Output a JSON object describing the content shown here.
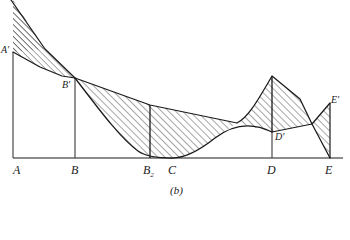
{
  "figure": {
    "caption": "(b)",
    "axis_labels": [
      {
        "id": "A",
        "text": "A",
        "x": 13,
        "y": 171
      },
      {
        "id": "B",
        "text": "B",
        "x": 71,
        "y": 171
      },
      {
        "id": "B2",
        "text": "B",
        "sub": "2",
        "x": 144,
        "y": 171
      },
      {
        "id": "C",
        "text": "C",
        "x": 170,
        "y": 171
      },
      {
        "id": "D",
        "text": "D",
        "x": 267,
        "y": 171
      },
      {
        "id": "E",
        "text": "E",
        "x": 325,
        "y": 171
      }
    ],
    "point_labels": [
      {
        "id": "Aprime",
        "text": "A′",
        "x": 2,
        "y": 46
      },
      {
        "id": "Bprime",
        "text": "B′",
        "x": 62,
        "y": 80
      },
      {
        "id": "Dprime",
        "text": "D′",
        "x": 274,
        "y": 131
      },
      {
        "id": "Eprime",
        "text": "E′",
        "x": 330,
        "y": 97
      }
    ],
    "colors": {
      "stroke": "#1a1a1a",
      "hatch": "#2b2b2b",
      "background": "#ffffff",
      "ordinate": "#3a3a3a"
    },
    "geometry": {
      "baseline_y": 158,
      "x_A": 13,
      "x_B": 75,
      "x_B2": 150,
      "x_C": 172,
      "x_D": 272,
      "x_E": 330,
      "y_Aprime": 52,
      "y_Bprime": 79,
      "y_Dprime": 132,
      "y_Eprime": 103,
      "apex_top_x": 11,
      "peak_D_x": 272,
      "peak_D_y": 76
    }
  }
}
